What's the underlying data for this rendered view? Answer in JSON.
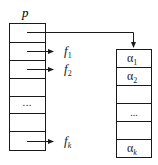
{
  "diagram": {
    "pointer_label": "p",
    "left_array": {
      "rows": 7,
      "cells": [
        "",
        "",
        "",
        "",
        "...",
        "",
        ""
      ],
      "field_labels": [
        {
          "row": 1,
          "base": "f",
          "sub": "1"
        },
        {
          "row": 2,
          "base": "f",
          "sub": "2"
        },
        {
          "row": 6,
          "base": "f",
          "sub": "k"
        }
      ]
    },
    "right_array": {
      "rows": 6,
      "cells": [
        {
          "base": "α",
          "sub": "1"
        },
        {
          "base": "α",
          "sub": "2"
        },
        {
          "base": "",
          "sub": ""
        },
        {
          "base": "...",
          "sub": ""
        },
        {
          "base": "",
          "sub": ""
        },
        {
          "base": "α",
          "sub": "k"
        }
      ]
    },
    "line_color": "#1a1a1a"
  }
}
